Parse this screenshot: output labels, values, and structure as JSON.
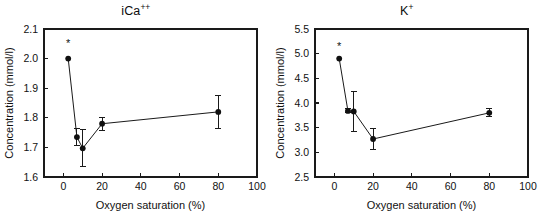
{
  "figure": {
    "panels": [
      "ica",
      "k"
    ]
  },
  "chart_data": [
    {
      "type": "scatter",
      "id": "ica",
      "title": "iCa",
      "title_superscript": "++",
      "title_full": "iCa++",
      "xlabel": "Oxygen saturation (%)",
      "ylabel": "Concentration (mmol/l)",
      "xlim": [
        -10,
        100
      ],
      "ylim": [
        1.6,
        2.1
      ],
      "xticks": [
        0,
        20,
        40,
        60,
        80,
        100
      ],
      "xticklabels": [
        "0",
        "20",
        "40",
        "60",
        "80",
        "100"
      ],
      "yticks": [
        1.6,
        1.7,
        1.8,
        1.9,
        2.0,
        2.1
      ],
      "yticklabels": [
        "1.6",
        "1.7",
        "1.8",
        "1.9",
        "2.0",
        "2.1"
      ],
      "grid": false,
      "legend": "none",
      "marker": "filled-circle",
      "connected": true,
      "x": [
        2.5,
        7.0,
        10.0,
        20.0,
        80.0
      ],
      "values": [
        2.0,
        1.735,
        1.697,
        1.78,
        1.82
      ],
      "yerr": [
        0.0,
        0.03,
        0.062,
        0.022,
        0.055
      ],
      "annotations": [
        {
          "text": "*",
          "x": 2.5,
          "y": 2.04
        }
      ]
    },
    {
      "type": "scatter",
      "id": "k",
      "title": "K",
      "title_superscript": "+",
      "title_full": "K+",
      "xlabel": "Oxygen saturation (%)",
      "ylabel": "Concentration (mmol/l)",
      "xlim": [
        -10,
        100
      ],
      "ylim": [
        2.5,
        5.5
      ],
      "xticks": [
        0,
        20,
        40,
        60,
        80,
        100
      ],
      "xticklabels": [
        "0",
        "20",
        "40",
        "60",
        "80",
        "100"
      ],
      "yticks": [
        2.5,
        3.0,
        3.5,
        4.0,
        4.5,
        5.0,
        5.5
      ],
      "yticklabels": [
        "2.5",
        "3.0",
        "3.5",
        "4.0",
        "4.5",
        "5.0",
        "5.5"
      ],
      "grid": false,
      "legend": "none",
      "marker": "filled-circle",
      "connected": true,
      "x": [
        2.5,
        7.0,
        10.0,
        20.0,
        80.0
      ],
      "values": [
        4.9,
        3.84,
        3.83,
        3.27,
        3.8
      ],
      "yerr": [
        0.0,
        0.04,
        0.4,
        0.21,
        0.08
      ],
      "annotations": [
        {
          "text": "*",
          "x": 2.5,
          "y": 5.07
        }
      ]
    }
  ],
  "colors": {
    "ink": "#1a1a1a",
    "marker": "#101010",
    "background": "#ffffff"
  }
}
